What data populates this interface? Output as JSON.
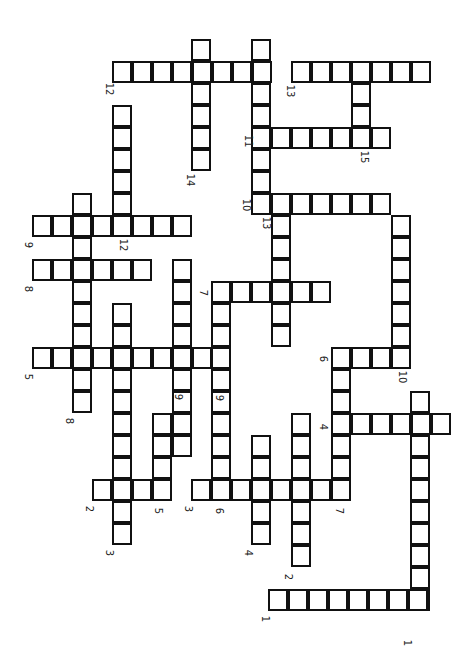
{
  "puzzle": {
    "type": "crossword",
    "orientation": "rotated-90-clockwise",
    "cell_size": {
      "w": 20,
      "h": 22
    },
    "colors": {
      "border": "#111111",
      "cell": "#ffffff",
      "background": "#ffffff",
      "label": "#222222"
    },
    "words": [
      {
        "label": "12",
        "dir": "h",
        "x": 112,
        "y": 61,
        "len": 8,
        "lx": 103,
        "ly": 84
      },
      {
        "label": "14",
        "dir": "v",
        "x": 191,
        "y": 39,
        "len": 6,
        "lx": 184,
        "ly": 175
      },
      {
        "label": "11",
        "dir": "v",
        "x": 251,
        "y": 39,
        "len": 8,
        "lx": 242,
        "ly": 136
      },
      {
        "label": "13",
        "dir": "h",
        "x": 291,
        "y": 61,
        "len": 7,
        "lx": 284,
        "ly": 86
      },
      {
        "label": "15",
        "dir": "v",
        "x": 351,
        "y": 61,
        "len": 4,
        "lx": 358,
        "ly": 152
      },
      {
        "label": "11",
        "dir": "h",
        "x": 251,
        "y": 127,
        "len": 7,
        "lx": 242,
        "ly": 136
      },
      {
        "label": "10",
        "dir": "h",
        "x": 251,
        "y": 193,
        "len": 7,
        "lx": 240,
        "ly": 200
      },
      {
        "label": "13",
        "dir": "v",
        "x": 271,
        "y": 215,
        "len": 6,
        "lx": 260,
        "ly": 218
      },
      {
        "label": "10",
        "dir": "v",
        "x": 391,
        "y": 215,
        "len": 7,
        "lx": 396,
        "ly": 372
      },
      {
        "label": "12",
        "dir": "v",
        "x": 112,
        "y": 105,
        "len": 6,
        "lx": 117,
        "ly": 240
      },
      {
        "label": "9",
        "dir": "h",
        "x": 32,
        "y": 215,
        "len": 8,
        "lx": 25,
        "ly": 240
      },
      {
        "label": "8",
        "dir": "v",
        "x": 72,
        "y": 193,
        "len": 10,
        "lx": 66,
        "ly": 416
      },
      {
        "label": "8",
        "dir": "h",
        "x": 32,
        "y": 259,
        "len": 6,
        "lx": 25,
        "ly": 284
      },
      {
        "label": "9",
        "dir": "v",
        "x": 172,
        "y": 259,
        "len": 9,
        "lx": 175,
        "ly": 392
      },
      {
        "label": "7",
        "dir": "h",
        "x": 211,
        "y": 281,
        "len": 6,
        "lx": 200,
        "ly": 288
      },
      {
        "label": "7",
        "dir": "v",
        "x": 211,
        "y": 281,
        "len": 10,
        "lx": 200,
        "ly": 288
      },
      {
        "label": "5",
        "dir": "h",
        "x": 32,
        "y": 347,
        "len": 10,
        "lx": 25,
        "ly": 372
      },
      {
        "label": "3",
        "dir": "v",
        "x": 112,
        "y": 303,
        "len": 11,
        "lx": 106,
        "ly": 548
      },
      {
        "label": "6",
        "dir": "h",
        "x": 331,
        "y": 347,
        "len": 4,
        "lx": 320,
        "ly": 354
      },
      {
        "label": "6",
        "dir": "v",
        "x": 331,
        "y": 347,
        "len": 7,
        "lx": 320,
        "ly": 354
      },
      {
        "label": "4",
        "dir": "h",
        "x": 331,
        "y": 413,
        "len": 6,
        "lx": 320,
        "ly": 422
      },
      {
        "label": "1",
        "dir": "v",
        "x": 410,
        "y": 391,
        "len": 10,
        "lx": 404,
        "ly": 638
      },
      {
        "label": "5",
        "dir": "v",
        "x": 152,
        "y": 413,
        "len": 4,
        "lx": 155,
        "ly": 506
      },
      {
        "label": "2",
        "dir": "h",
        "x": 92,
        "y": 479,
        "len": 4,
        "lx": 86,
        "ly": 504
      },
      {
        "label": "3",
        "dir": "h",
        "x": 191,
        "y": 479,
        "len": 8,
        "lx": 185,
        "ly": 504
      },
      {
        "label": "4",
        "dir": "v",
        "x": 251,
        "y": 435,
        "len": 5,
        "lx": 245,
        "ly": 548
      },
      {
        "label": "2",
        "dir": "v",
        "x": 291,
        "y": 413,
        "len": 7,
        "lx": 285,
        "ly": 572
      },
      {
        "label": "1",
        "dir": "h",
        "x": 268,
        "y": 589,
        "len": 8,
        "lx": 262,
        "ly": 614
      }
    ],
    "extra_labels": [
      {
        "label": "6",
        "lx": 216,
        "ly": 506
      },
      {
        "label": "9",
        "lx": 216,
        "ly": 393
      },
      {
        "label": "7",
        "lx": 336,
        "ly": 506
      }
    ]
  }
}
